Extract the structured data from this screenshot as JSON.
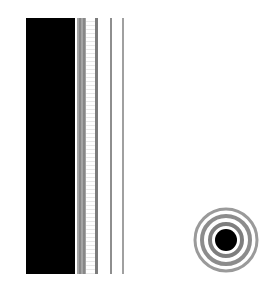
{
  "figure": {
    "colors": {
      "background": "#ffffff",
      "bar": "#000000",
      "stripe": "#8a8a8a",
      "ring": "#8c8c8c",
      "core": "#000000"
    },
    "stripes": [
      {
        "x": 77,
        "width": 9
      },
      {
        "x": 95,
        "width": 3
      },
      {
        "x": 110,
        "width": 2
      },
      {
        "x": 122,
        "width": 2
      }
    ],
    "target": {
      "cx": 226,
      "cy": 240,
      "outer_radius": 33,
      "core_radius": 11,
      "rings": 3
    }
  }
}
